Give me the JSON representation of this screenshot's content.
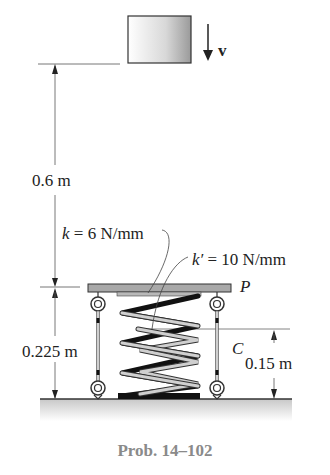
{
  "figure": {
    "caption": "Prob. 14–102",
    "labels": {
      "velocity": "v",
      "drop_height": "0.6 m",
      "k_label_sym": "k",
      "k_label_val": " = 6 N/mm",
      "kprime_label_sym": "k′",
      "kprime_label_val": " = 10 N/mm",
      "plate": "P",
      "point_c": "C",
      "plate_height": "0.225 m",
      "inner_spring_height": "0.15 m"
    },
    "colors": {
      "line": "#333333",
      "plate": "#a8a8a8",
      "ground": "#d8d8d8",
      "caption": "#8a8a8a",
      "outer_spring": "#111111",
      "inner_spring": "#c8c8c8"
    }
  }
}
